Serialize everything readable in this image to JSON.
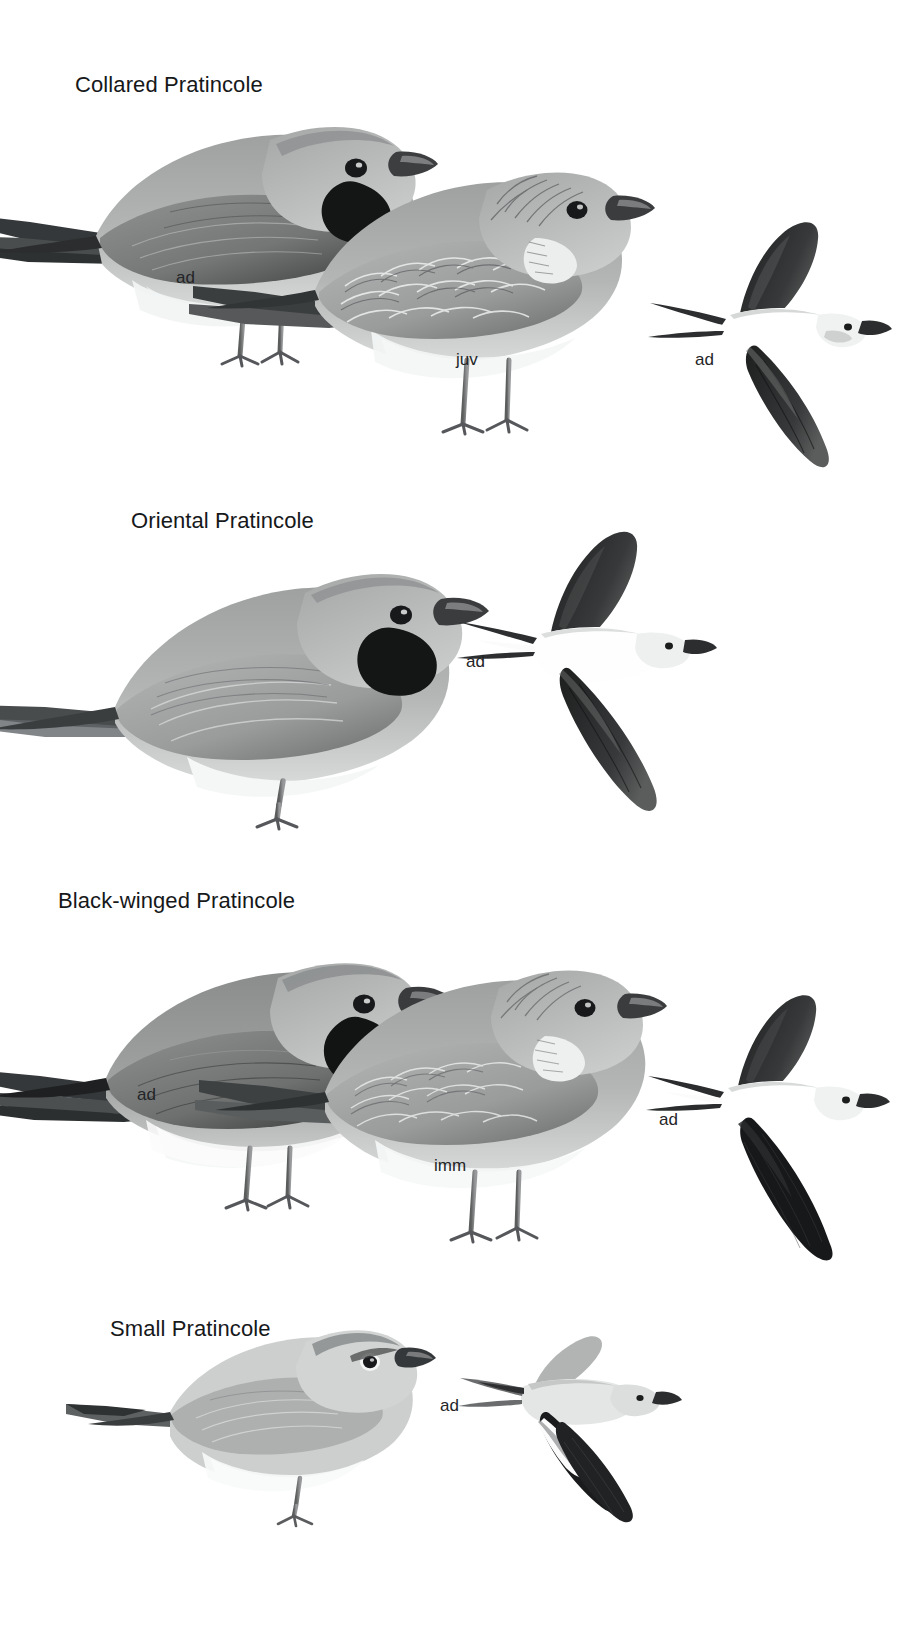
{
  "page": {
    "kind": "field-guide-plate",
    "background_color": "#ffffff",
    "width": 923,
    "height": 1629,
    "ink_color": "#16181a",
    "palette": {
      "dark": "#2b2b2b",
      "mid_dark": "#5d5f5f",
      "mid": "#8a8c8c",
      "light": "#b9bbbb",
      "pale": "#dcdede",
      "white": "#ffffff"
    }
  },
  "species": [
    {
      "id": "collared-pratincole",
      "title": "Collared Pratincole",
      "title_x": 75,
      "title_y": 72,
      "figures": [
        {
          "id": "collared-ad-standing",
          "pose": "standing",
          "label": "ad",
          "label_x": 176,
          "label_y": 268
        },
        {
          "id": "collared-juv-standing",
          "pose": "standing",
          "label": "juv",
          "label_x": 456,
          "label_y": 350
        },
        {
          "id": "collared-ad-flight",
          "pose": "flight",
          "label": "ad",
          "label_x": 695,
          "label_y": 350
        }
      ]
    },
    {
      "id": "oriental-pratincole",
      "title": "Oriental Pratincole",
      "title_x": 131,
      "title_y": 508,
      "figures": [
        {
          "id": "oriental-ad-standing",
          "pose": "standing",
          "label": "",
          "label_x": 0,
          "label_y": 0
        },
        {
          "id": "oriental-ad-flight",
          "pose": "flight",
          "label": "ad",
          "label_x": 466,
          "label_y": 652
        }
      ]
    },
    {
      "id": "black-winged-pratincole",
      "title": "Black-winged Pratincole",
      "title_x": 58,
      "title_y": 888,
      "figures": [
        {
          "id": "bw-ad-standing",
          "pose": "standing",
          "label": "ad",
          "label_x": 137,
          "label_y": 1085
        },
        {
          "id": "bw-imm-standing",
          "pose": "standing",
          "label": "imm",
          "label_x": 434,
          "label_y": 1156
        },
        {
          "id": "bw-ad-flight",
          "pose": "flight",
          "label": "ad",
          "label_x": 659,
          "label_y": 1110
        }
      ]
    },
    {
      "id": "small-pratincole",
      "title": "Small Pratincole",
      "title_x": 110,
      "title_y": 1316,
      "figures": [
        {
          "id": "small-ad-standing",
          "pose": "standing",
          "label": "",
          "label_x": 0,
          "label_y": 0
        },
        {
          "id": "small-ad-flight",
          "pose": "flight",
          "label": "ad",
          "label_x": 440,
          "label_y": 1396
        }
      ]
    }
  ]
}
